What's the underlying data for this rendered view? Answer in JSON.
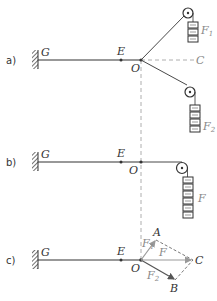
{
  "panels": {
    "a": {
      "tag": "a)",
      "G": "G",
      "E": "E",
      "O": "O",
      "C": "C",
      "F1": "F",
      "F1_sub": "1",
      "F2": "F",
      "F2_sub": "2"
    },
    "b": {
      "tag": "b)",
      "G": "G",
      "E": "E",
      "O": "O",
      "F": "F"
    },
    "c": {
      "tag": "c)",
      "G": "G",
      "E": "E",
      "O": "O",
      "A": "A",
      "B": "B",
      "C": "C",
      "F1": "F",
      "F1_sub": "1",
      "F2": "F",
      "F2_sub": "2",
      "F": "F"
    }
  },
  "colors": {
    "line": "#333333",
    "grey": "#999999",
    "dashed": "#999999"
  }
}
